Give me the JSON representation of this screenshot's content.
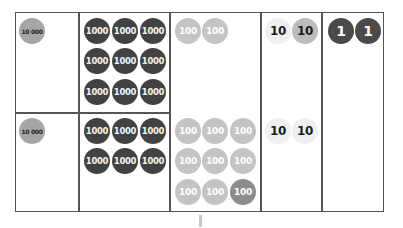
{
  "board": {
    "columns": [
      "ten-thousands",
      "thousands",
      "hundreds",
      "tens",
      "ones"
    ],
    "rows": {
      "top": {
        "ten_thousands": [
          "10 000"
        ],
        "thousands": [
          "1000",
          "1000",
          "1000",
          "1000",
          "1000",
          "1000",
          "1000",
          "1000",
          "1000"
        ],
        "hundreds": [
          "100",
          "100"
        ],
        "tens": [
          "10",
          "10"
        ],
        "ones": [
          "1",
          "1"
        ]
      },
      "bottom": {
        "ten_thousands": [
          "10 000"
        ],
        "thousands": [
          "1000",
          "1000",
          "1000",
          "1000",
          "1000",
          "1000"
        ],
        "hundreds": [
          "100",
          "100",
          "100",
          "100",
          "100",
          "100",
          "100",
          "100",
          "100"
        ],
        "tens": [
          "10",
          "10"
        ]
      }
    }
  },
  "colors": {
    "grid_line": "#555555",
    "coin_10000": "#a6a6a6",
    "coin_1000": "#424242",
    "coin_100": "#c4c4c4",
    "coin_100_highlight": "#8d8d8d",
    "coin_10": "#f0f0f0",
    "coin_10_highlight": "#bcbcbc",
    "coin_1": "#4a4a4a"
  }
}
